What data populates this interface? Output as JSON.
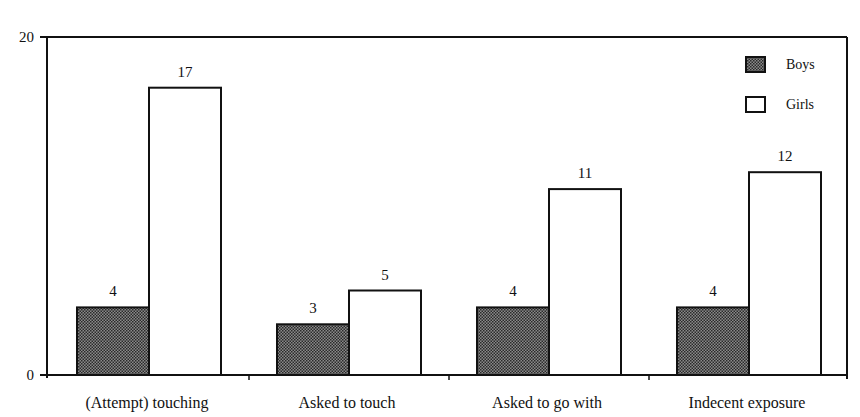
{
  "chart_data": {
    "type": "bar",
    "title": "",
    "xlabel": "",
    "ylabel": "",
    "ylim": [
      0,
      20
    ],
    "yticks": [
      0,
      20
    ],
    "grid": false,
    "legend_position": "top-right inside",
    "categories": [
      "(Attempt) touching",
      "Asked to touch",
      "Asked to go with",
      "Indecent exposure"
    ],
    "series": [
      {
        "name": "Boys",
        "values": [
          4,
          3,
          4,
          4
        ],
        "fill": "#555555",
        "pattern": "dotted-dark"
      },
      {
        "name": "Girls",
        "values": [
          17,
          5,
          11,
          12
        ],
        "fill": "#ffffff",
        "pattern": "none"
      }
    ],
    "data_labels": true
  },
  "legend": {
    "items": [
      "Boys",
      "Girls"
    ]
  },
  "axis": {
    "y_top_label": "20",
    "y_bottom_label": "0"
  },
  "colors": {
    "axis": "#111111",
    "boys": "#555555",
    "girls": "#ffffff"
  }
}
